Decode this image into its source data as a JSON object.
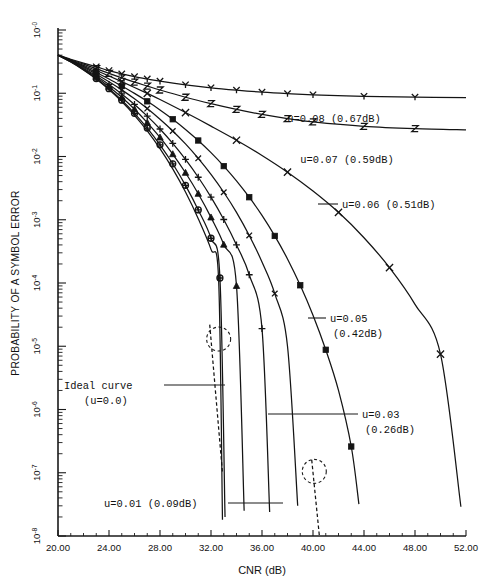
{
  "chart_data": {
    "type": "line",
    "title": "",
    "xlabel": "CNR (dB)",
    "ylabel": "PROBABILITY OF A SYMBOL ERROR",
    "xlim": [
      20.0,
      52.0
    ],
    "xticks": [
      "20.00",
      "24.00",
      "28.00",
      "32.00",
      "36.00",
      "40.00",
      "44.00",
      "48.00",
      "52.00"
    ],
    "xtick_values": [
      20,
      24,
      28,
      32,
      36,
      40,
      44,
      48,
      52
    ],
    "yscale": "log",
    "ylim": [
      1e-08,
      1
    ],
    "yticks": [
      "10-0",
      "10-1",
      "10-2",
      "10-3",
      "10-4",
      "10-5",
      "10-6",
      "10-7",
      "10-8"
    ],
    "ytick_exponents": [
      "-0",
      "-1",
      "-2",
      "-3",
      "-4",
      "-5",
      "-6",
      "-7",
      "-8"
    ],
    "grid": false,
    "legend_position": "inline-annotations",
    "series": [
      {
        "name": "u=0.08",
        "label": "u=0.08  (0.67dB)",
        "marker": "y-glyph",
        "x": [
          20,
          21,
          22,
          23,
          24,
          25,
          26,
          27,
          28,
          30,
          32,
          34,
          36,
          38,
          40,
          44,
          48,
          52
        ],
        "y": [
          0.4,
          0.345,
          0.3,
          0.262,
          0.228,
          0.202,
          0.183,
          0.168,
          0.155,
          0.136,
          0.122,
          0.112,
          0.104,
          0.0985,
          0.0945,
          0.0895,
          0.0868,
          0.0855
        ]
      },
      {
        "name": "u=0.07",
        "label": "u=0.07  (0.59dB)",
        "marker": "z-glyph",
        "x": [
          20,
          21,
          22,
          23,
          24,
          25,
          26,
          27,
          28,
          30,
          32,
          34,
          36,
          38,
          40,
          44,
          48,
          52
        ],
        "y": [
          0.4,
          0.338,
          0.288,
          0.245,
          0.206,
          0.175,
          0.15,
          0.13,
          0.1125,
          0.0865,
          0.0685,
          0.0555,
          0.0462,
          0.0398,
          0.0352,
          0.03,
          0.0276,
          0.0264
        ]
      },
      {
        "name": "u=0.06",
        "label": "u=0.06  (0.51dB)",
        "marker": "x-glyph",
        "x": [
          20,
          21,
          22,
          23,
          24,
          25,
          26,
          27,
          28,
          30,
          32,
          34,
          36,
          38,
          40,
          42,
          44,
          46,
          48,
          50,
          51.6
        ],
        "y": [
          0.4,
          0.332,
          0.276,
          0.229,
          0.1875,
          0.1525,
          0.1235,
          0.0995,
          0.0795,
          0.0495,
          0.0302,
          0.0181,
          0.0104,
          0.00565,
          0.00285,
          0.00131,
          0.00052,
          0.000175,
          4.6e-05,
          7.5e-06,
          2.9e-08
        ]
      },
      {
        "name": "u=0.05",
        "label_line1": "u=0.05",
        "label_line2": "(0.42dB)",
        "marker": "square-filled",
        "x": [
          20,
          21,
          22,
          23,
          24,
          25,
          26,
          27,
          28,
          29,
          30,
          31,
          32,
          33,
          34,
          35,
          36,
          37,
          38,
          39,
          40,
          41,
          42,
          43,
          43.6
        ],
        "y": [
          0.4,
          0.328,
          0.266,
          0.213,
          0.168,
          0.13,
          0.0995,
          0.0745,
          0.0545,
          0.0388,
          0.0268,
          0.0179,
          0.0115,
          0.00705,
          0.00412,
          0.00227,
          0.00117,
          0.000555,
          0.00024,
          9.2e-05,
          3.1e-05,
          8.8e-06,
          2e-06,
          2.6e-07,
          3.2e-08
        ]
      },
      {
        "name": "u=0.04",
        "marker": "x-small",
        "x": [
          20,
          21,
          22,
          23,
          24,
          25,
          26,
          27,
          28,
          29,
          30,
          31,
          32,
          33,
          34,
          35,
          36,
          37,
          38,
          38.8
        ],
        "y": [
          0.4,
          0.324,
          0.257,
          0.2,
          0.152,
          0.113,
          0.0815,
          0.0572,
          0.0388,
          0.0253,
          0.0158,
          0.00935,
          0.00522,
          0.00272,
          0.00131,
          0.000565,
          0.000215,
          6.8e-05,
          1e-05,
          3e-08
        ]
      },
      {
        "name": "u=0.03",
        "label_line1": "u=0.03",
        "label_line2": "(0.26dB)",
        "marker": "plus",
        "x": [
          20,
          21,
          22,
          23,
          24,
          25,
          26,
          27,
          28,
          29,
          30,
          31,
          32,
          33,
          34,
          35,
          36,
          36.6
        ],
        "y": [
          0.4,
          0.32,
          0.249,
          0.188,
          0.138,
          0.0975,
          0.0665,
          0.0435,
          0.0272,
          0.0161,
          0.00898,
          0.0047,
          0.00228,
          0.00101,
          0.0004,
          0.000135,
          1.9e-05,
          2.4e-08
        ]
      },
      {
        "name": "u=0.02",
        "marker": "triangle-filled",
        "x": [
          20,
          21,
          22,
          23,
          24,
          25,
          26,
          27,
          28,
          29,
          30,
          31,
          32,
          33,
          34,
          34.6
        ],
        "y": [
          0.4,
          0.317,
          0.242,
          0.179,
          0.127,
          0.0862,
          0.0559,
          0.0344,
          0.02,
          0.0109,
          0.00553,
          0.00258,
          0.00109,
          0.000405,
          9e-05,
          2.5e-08
        ]
      },
      {
        "name": "u=0.01",
        "label": "u=0.01  (0.09dB)",
        "marker": "circle-plus",
        "x": [
          20,
          21,
          22,
          23,
          24,
          25,
          26,
          27,
          28,
          29,
          30,
          31,
          32,
          32.7,
          33.1
        ],
        "y": [
          0.4,
          0.314,
          0.236,
          0.171,
          0.118,
          0.0776,
          0.0482,
          0.0281,
          0.0153,
          0.00767,
          0.0035,
          0.00143,
          0.00051,
          0.00012,
          2e-08
        ]
      },
      {
        "name": "Ideal curve",
        "label_line1": "Ideal curve",
        "label_line2": "(u=0.0)",
        "marker": "none",
        "x": [
          20,
          21,
          22,
          23,
          24,
          25,
          26,
          27,
          28,
          29,
          30,
          31,
          32,
          32.6,
          32.9
        ],
        "y": [
          0.4,
          0.313,
          0.234,
          0.168,
          0.114,
          0.0737,
          0.0448,
          0.0254,
          0.0133,
          0.00636,
          0.00274,
          0.00104,
          0.00034,
          0.00011,
          1.8e-08
        ]
      }
    ],
    "annotations": [
      {
        "id": "ann-u008",
        "text": "u=0.08  (0.67dB)"
      },
      {
        "id": "ann-u007",
        "text": "u=0.07  (0.59dB)"
      },
      {
        "id": "ann-u006",
        "text": "u=0.06  (0.51dB)"
      },
      {
        "id": "ann-u005",
        "text": "u=0.05"
      },
      {
        "id": "ann-u005b",
        "text": "(0.42dB)"
      },
      {
        "id": "ann-u003",
        "text": "u=0.03"
      },
      {
        "id": "ann-u003b",
        "text": "(0.26dB)"
      },
      {
        "id": "ann-ideal",
        "text": "Ideal curve"
      },
      {
        "id": "ann-idealb",
        "text": "(u=0.0)"
      },
      {
        "id": "ann-u001",
        "text": "u=0.01  (0.09dB)"
      }
    ],
    "highlight_circles": [
      {
        "id": "highlight-left",
        "cx": 32.6,
        "cy": 1.3e-05
      },
      {
        "id": "highlight-right",
        "cx": 40.1,
        "cy": 1.05e-07
      }
    ]
  },
  "axes": {
    "x_title": "CNR (dB)",
    "y_title": "PROBABILITY OF A SYMBOL ERROR"
  }
}
